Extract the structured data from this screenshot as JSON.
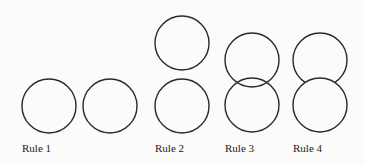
{
  "figure": {
    "stroke_color": "#2a2a2a",
    "background": "#fbfbf9",
    "panels": [
      {
        "label": "Rule 1",
        "description": "two circles side by side, not touching"
      },
      {
        "label": "Rule 2",
        "description": "two circles stacked vertically, not touching"
      },
      {
        "label": "Rule 3",
        "description": "two circles stacked and overlapping, both outlines fully visible (transparent)"
      },
      {
        "label": "Rule 4",
        "description": "two circles stacked and overlapping, bottom circle occludes top circle"
      }
    ]
  }
}
